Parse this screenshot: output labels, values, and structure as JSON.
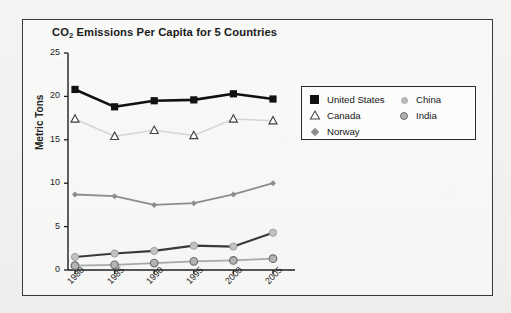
{
  "figure": {
    "border_color": "#3a3a3a",
    "background": "#f2f2f0"
  },
  "legend": {
    "position": "right-upper",
    "columns": [
      {
        "items": [
          {
            "label": "United States",
            "marker": "filled-square-icon",
            "color": "#111111"
          },
          {
            "label": "Canada",
            "marker": "open-triangle-icon",
            "color": "#d8d8d8"
          },
          {
            "label": "Norway",
            "marker": "diamond-icon",
            "color": "#8d8d8d"
          }
        ]
      },
      {
        "items": [
          {
            "label": "China",
            "marker": "light-circle-icon",
            "color": "#b9b9b9"
          },
          {
            "label": "India",
            "marker": "gray-circle-icon",
            "color": "#b0b0b0"
          }
        ]
      }
    ]
  },
  "chart_data": {
    "type": "line",
    "title": "CO2 Emissions Per Capita for 5 Countries",
    "title_main": "CO",
    "title_sub": "2",
    "title_rest": " Emissions Per Capita for 5 Countries",
    "xlabel": "",
    "ylabel": "Metric Tons",
    "categories": [
      "1980",
      "1985",
      "1990",
      "1995",
      "2000",
      "2005"
    ],
    "x": [
      1980,
      1985,
      1990,
      1995,
      2000,
      2005
    ],
    "ylim": [
      0,
      25
    ],
    "yticks": [
      0,
      5,
      10,
      15,
      20,
      25
    ],
    "grid": false,
    "legend_position": "upper right",
    "series": [
      {
        "name": "United States",
        "values": [
          20.8,
          18.8,
          19.5,
          19.6,
          20.3,
          19.7
        ],
        "color": "#111111",
        "marker": "square",
        "line_width": 2.6
      },
      {
        "name": "Canada",
        "values": [
          17.4,
          15.4,
          16.1,
          15.5,
          17.4,
          17.2
        ],
        "color": "#d5d5d5",
        "marker": "open-triangle",
        "line_width": 1.6
      },
      {
        "name": "Norway",
        "values": [
          8.7,
          8.5,
          7.5,
          7.7,
          8.7,
          10.0
        ],
        "color": "#8d8d8d",
        "marker": "diamond",
        "line_width": 1.8
      },
      {
        "name": "China",
        "values": [
          1.5,
          1.9,
          2.2,
          2.8,
          2.7,
          4.3
        ],
        "color": "#3a3a3a",
        "marker": "light-circle",
        "line_width": 2.2
      },
      {
        "name": "India",
        "values": [
          0.5,
          0.6,
          0.8,
          1.0,
          1.1,
          1.3
        ],
        "color": "#a8a8a8",
        "marker": "gray-circle",
        "line_width": 1.8
      }
    ]
  }
}
